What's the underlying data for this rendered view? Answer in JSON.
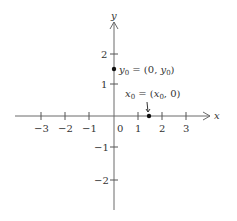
{
  "diagram": {
    "type": "coordinate-plane",
    "axes": {
      "x_label": "x",
      "y_label": "y"
    },
    "x_ticks": [
      {
        "value": -3,
        "label": "−3"
      },
      {
        "value": -2,
        "label": "−2"
      },
      {
        "value": -1,
        "label": "−1"
      },
      {
        "value": 1,
        "label": "1"
      },
      {
        "value": 2,
        "label": "2"
      },
      {
        "value": 3,
        "label": "3"
      }
    ],
    "origin_label": "0",
    "y_ticks": [
      {
        "value": 2,
        "label": "2"
      },
      {
        "value": 1,
        "label": "1"
      },
      {
        "value": -1,
        "label": "−1"
      },
      {
        "value": -2,
        "label": "−2"
      }
    ],
    "points": [
      {
        "name": "y0",
        "coords": [
          0,
          1.5
        ],
        "label_main": "y",
        "label_sub": "0",
        "label_rest": " = (0, ",
        "label_var": "y",
        "label_var_sub": "0",
        "label_close": ")"
      },
      {
        "name": "x0",
        "coords": [
          1.5,
          0
        ],
        "label_main": "x",
        "label_sub": "0",
        "label_rest": " = (",
        "label_var": "x",
        "label_var_sub": "0",
        "label_close": ", 0)"
      }
    ]
  }
}
